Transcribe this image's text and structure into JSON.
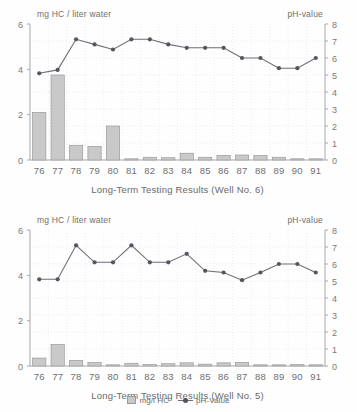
{
  "legend": {
    "bar_label": "mg/l HC",
    "line_label": "pH-Value"
  },
  "colors": {
    "bar_fill": "#c9c9c9",
    "bar_stroke": "#9a9a9a",
    "line": "#6e6e78",
    "marker": "#55555f",
    "axis": "#a8a8a8",
    "grid": "#e2e2e2",
    "text": "#6f6f6f"
  },
  "chart_data": [
    {
      "type": "bar",
      "id": "well-6",
      "title": "Long-Term Testing Results (Well No. 6)",
      "ylabel_left": "mg HC / liter water",
      "ylabel_right": "pH-value",
      "xlabel": "",
      "categories": [
        "76",
        "77",
        "78",
        "79",
        "80",
        "81",
        "82",
        "83",
        "84",
        "85",
        "86",
        "87",
        "88",
        "89",
        "90",
        "91"
      ],
      "ylim_left": [
        0,
        6
      ],
      "yticks_left": [
        0,
        2,
        4,
        6
      ],
      "ylim_right": [
        0,
        8
      ],
      "yticks_right": [
        0,
        1,
        2,
        3,
        4,
        5,
        6,
        7,
        8
      ],
      "grid": true,
      "legend_position": "bottom",
      "series": [
        {
          "name": "mg/l HC",
          "type": "bar",
          "axis": "left",
          "values": [
            2.1,
            3.75,
            0.65,
            0.6,
            1.5,
            0.05,
            0.12,
            0.1,
            0.3,
            0.12,
            0.2,
            0.22,
            0.2,
            0.12,
            0.05,
            0.02
          ]
        },
        {
          "name": "pH-Value",
          "type": "line",
          "axis": "right",
          "values": [
            5.1,
            5.3,
            7.1,
            6.8,
            6.5,
            7.1,
            7.1,
            6.8,
            6.6,
            6.6,
            6.6,
            6.0,
            6.0,
            5.4,
            5.4,
            6.0
          ]
        }
      ]
    },
    {
      "type": "bar",
      "id": "well-5",
      "title": "Long-Term Testing Results (Well No. 5)",
      "ylabel_left": "mg HC / liter water",
      "ylabel_right": "pH-value",
      "xlabel": "",
      "categories": [
        "76",
        "77",
        "78",
        "79",
        "80",
        "81",
        "82",
        "83",
        "84",
        "85",
        "86",
        "87",
        "88",
        "89",
        "90",
        "91"
      ],
      "ylim_left": [
        0,
        6
      ],
      "yticks_left": [
        0,
        2,
        4,
        6
      ],
      "ylim_right": [
        0,
        8
      ],
      "yticks_right": [
        0,
        1,
        2,
        3,
        4,
        5,
        6,
        7,
        8
      ],
      "grid": true,
      "legend_position": "bottom",
      "series": [
        {
          "name": "mg/l HC",
          "type": "bar",
          "axis": "left",
          "values": [
            0.35,
            0.95,
            0.25,
            0.15,
            0.04,
            0.12,
            0.06,
            0.1,
            0.14,
            0.08,
            0.14,
            0.16,
            0.04,
            0.04,
            0.06,
            0.02
          ]
        },
        {
          "name": "pH-Value",
          "type": "line",
          "axis": "right",
          "values": [
            5.1,
            5.1,
            7.1,
            6.1,
            6.1,
            7.1,
            6.1,
            6.1,
            6.6,
            5.6,
            5.5,
            5.05,
            5.5,
            6.0,
            6.0,
            5.5
          ]
        }
      ]
    }
  ]
}
